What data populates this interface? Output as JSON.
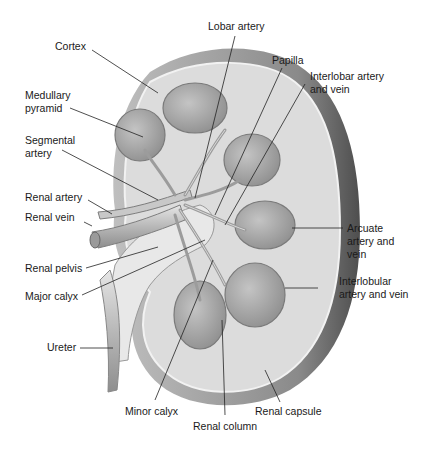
{
  "figure": {
    "colors": {
      "background": "#ffffff",
      "capsule_dark": "#6e6e6e",
      "cortex": "#d9d9d9",
      "pyramid": "#a8a8a8",
      "vessel": "#bdbdbd",
      "leader_line": "#222222",
      "label_text": "#1a1a1a"
    }
  },
  "labels": {
    "cortex": "Cortex",
    "medullary_pyramid": "Medullary\npyramid",
    "segmental_artery": "Segmental\nartery",
    "renal_artery": "Renal artery",
    "renal_vein": "Renal vein",
    "renal_pelvis": "Renal pelvis",
    "major_calyx": "Major calyx",
    "ureter": "Ureter",
    "minor_calyx": "Minor calyx",
    "renal_column": "Renal column",
    "renal_capsule": "Renal capsule",
    "interlobular": "Interlobular\nartery and vein",
    "arcuate": "Arcuate\nartery and\nvein",
    "interlobar": "Interlobar artery\nand vein",
    "papilla": "Papilla",
    "lobar_artery": "Lobar artery"
  }
}
